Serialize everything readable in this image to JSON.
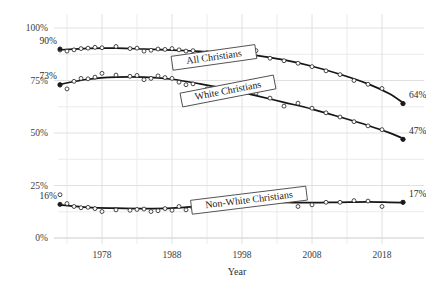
{
  "chart_data": {
    "type": "scatter",
    "title": "",
    "subtitle": "",
    "xlabel": "Year",
    "ylabel": "",
    "xlim": [
      1972,
      2022
    ],
    "ylim": [
      0,
      100
    ],
    "grid": true,
    "legend_position": "inline-labels",
    "xticks": [
      1978,
      1988,
      1998,
      2008,
      2018
    ],
    "xtick_labels": [
      "1978",
      "1988",
      "1998",
      "2008",
      "2018"
    ],
    "yticks": [
      0,
      25,
      50,
      75,
      100
    ],
    "ytick_labels": [
      "0%",
      "25%",
      "50%",
      "75%",
      "100%"
    ],
    "annotations": [
      {
        "text": "90%",
        "series": "All Christians",
        "side": "left",
        "x": 1972,
        "y": 90
      },
      {
        "text": "73%",
        "series": "White Christians",
        "side": "left",
        "x": 1972,
        "y": 73
      },
      {
        "text": "16%",
        "series": "Non-White Christians",
        "side": "left",
        "x": 1972,
        "y": 16
      },
      {
        "text": "64%",
        "series": "All Christians",
        "side": "right",
        "x": 2021,
        "y": 64
      },
      {
        "text": "47%",
        "series": "White Christians",
        "side": "right",
        "x": 2021,
        "y": 47
      },
      {
        "text": "17%",
        "series": "Non-White Christians",
        "side": "right",
        "x": 2021,
        "y": 17
      }
    ],
    "series": [
      {
        "name": "All Christians",
        "label": "All Christians",
        "label_x": 1994,
        "label_y": 86,
        "label_rotation": -8,
        "start_value": 90,
        "end_value": 64,
        "color": "#151515",
        "points": [
          {
            "x": 1972,
            "y": 89.5
          },
          {
            "x": 1973,
            "y": 89.0
          },
          {
            "x": 1974,
            "y": 89.6
          },
          {
            "x": 1975,
            "y": 90.2
          },
          {
            "x": 1976,
            "y": 90.4
          },
          {
            "x": 1977,
            "y": 90.8
          },
          {
            "x": 1978,
            "y": 90.6
          },
          {
            "x": 1980,
            "y": 91.2
          },
          {
            "x": 1982,
            "y": 90.2
          },
          {
            "x": 1983,
            "y": 90.4
          },
          {
            "x": 1984,
            "y": 89.0
          },
          {
            "x": 1985,
            "y": 89.4
          },
          {
            "x": 1986,
            "y": 90.0
          },
          {
            "x": 1987,
            "y": 89.8
          },
          {
            "x": 1988,
            "y": 90.2
          },
          {
            "x": 1989,
            "y": 89.6
          },
          {
            "x": 1990,
            "y": 89.0
          },
          {
            "x": 1991,
            "y": 89.2
          },
          {
            "x": 1993,
            "y": 88.2
          },
          {
            "x": 1994,
            "y": 88.4
          },
          {
            "x": 1996,
            "y": 87.6
          },
          {
            "x": 1998,
            "y": 88.2
          },
          {
            "x": 2000,
            "y": 89.2
          },
          {
            "x": 2002,
            "y": 85.6
          },
          {
            "x": 2004,
            "y": 84.4
          },
          {
            "x": 2006,
            "y": 83.2
          },
          {
            "x": 2008,
            "y": 81.6
          },
          {
            "x": 2010,
            "y": 79.6
          },
          {
            "x": 2012,
            "y": 77.8
          },
          {
            "x": 2014,
            "y": 75.0
          },
          {
            "x": 2016,
            "y": 73.2
          },
          {
            "x": 2018,
            "y": 71.2
          },
          {
            "x": 2021,
            "y": 64.0
          }
        ],
        "fit": [
          {
            "x": 1972,
            "y": 89.6
          },
          {
            "x": 1976,
            "y": 90.3
          },
          {
            "x": 1980,
            "y": 90.4
          },
          {
            "x": 1984,
            "y": 90.0
          },
          {
            "x": 1988,
            "y": 89.5
          },
          {
            "x": 1992,
            "y": 88.9
          },
          {
            "x": 1996,
            "y": 88.2
          },
          {
            "x": 2000,
            "y": 87.0
          },
          {
            "x": 2004,
            "y": 84.8
          },
          {
            "x": 2008,
            "y": 81.8
          },
          {
            "x": 2012,
            "y": 78.0
          },
          {
            "x": 2016,
            "y": 73.4
          },
          {
            "x": 2019,
            "y": 68.8
          },
          {
            "x": 2021,
            "y": 64.4
          }
        ]
      },
      {
        "name": "White Christians",
        "label": "White Christians",
        "label_x": 1996,
        "label_y": 70,
        "label_rotation": -11,
        "start_value": 73,
        "end_value": 47,
        "color": "#151515",
        "points": [
          {
            "x": 1972,
            "y": 72.8
          },
          {
            "x": 1973,
            "y": 71.0
          },
          {
            "x": 1974,
            "y": 74.6
          },
          {
            "x": 1975,
            "y": 76.0
          },
          {
            "x": 1976,
            "y": 75.8
          },
          {
            "x": 1977,
            "y": 76.6
          },
          {
            "x": 1978,
            "y": 78.4
          },
          {
            "x": 1980,
            "y": 77.6
          },
          {
            "x": 1982,
            "y": 77.0
          },
          {
            "x": 1983,
            "y": 77.4
          },
          {
            "x": 1984,
            "y": 75.4
          },
          {
            "x": 1985,
            "y": 76.0
          },
          {
            "x": 1986,
            "y": 77.2
          },
          {
            "x": 1987,
            "y": 76.4
          },
          {
            "x": 1988,
            "y": 76.0
          },
          {
            "x": 1989,
            "y": 74.2
          },
          {
            "x": 1990,
            "y": 73.0
          },
          {
            "x": 1991,
            "y": 73.4
          },
          {
            "x": 1993,
            "y": 71.0
          },
          {
            "x": 1994,
            "y": 71.4
          },
          {
            "x": 1996,
            "y": 70.0
          },
          {
            "x": 1998,
            "y": 69.6
          },
          {
            "x": 2000,
            "y": 69.0
          },
          {
            "x": 2002,
            "y": 66.6
          },
          {
            "x": 2004,
            "y": 62.8
          },
          {
            "x": 2006,
            "y": 64.2
          },
          {
            "x": 2008,
            "y": 61.8
          },
          {
            "x": 2010,
            "y": 59.6
          },
          {
            "x": 2012,
            "y": 57.6
          },
          {
            "x": 2014,
            "y": 55.4
          },
          {
            "x": 2016,
            "y": 53.4
          },
          {
            "x": 2018,
            "y": 51.6
          },
          {
            "x": 2021,
            "y": 47.0
          }
        ],
        "fit": [
          {
            "x": 1972,
            "y": 73.2
          },
          {
            "x": 1976,
            "y": 75.6
          },
          {
            "x": 1980,
            "y": 76.6
          },
          {
            "x": 1984,
            "y": 76.6
          },
          {
            "x": 1988,
            "y": 75.6
          },
          {
            "x": 1992,
            "y": 73.4
          },
          {
            "x": 1996,
            "y": 70.8
          },
          {
            "x": 2000,
            "y": 67.8
          },
          {
            "x": 2004,
            "y": 64.6
          },
          {
            "x": 2008,
            "y": 61.4
          },
          {
            "x": 2012,
            "y": 57.6
          },
          {
            "x": 2016,
            "y": 53.6
          },
          {
            "x": 2019,
            "y": 50.2
          },
          {
            "x": 2021,
            "y": 47.4
          }
        ]
      },
      {
        "name": "Non-White Christians",
        "label": "Non-White Christians",
        "label_x": 1999,
        "label_y": 18,
        "label_rotation": -7,
        "start_value": 16,
        "end_value": 17,
        "color": "#151515",
        "points": [
          {
            "x": 1972,
            "y": 20.6
          },
          {
            "x": 1973,
            "y": 16.4
          },
          {
            "x": 1974,
            "y": 15.0
          },
          {
            "x": 1975,
            "y": 14.4
          },
          {
            "x": 1976,
            "y": 14.6
          },
          {
            "x": 1977,
            "y": 14.0
          },
          {
            "x": 1978,
            "y": 12.6
          },
          {
            "x": 1980,
            "y": 13.4
          },
          {
            "x": 1982,
            "y": 13.2
          },
          {
            "x": 1983,
            "y": 13.6
          },
          {
            "x": 1984,
            "y": 13.8
          },
          {
            "x": 1985,
            "y": 12.6
          },
          {
            "x": 1986,
            "y": 13.0
          },
          {
            "x": 1987,
            "y": 14.0
          },
          {
            "x": 1988,
            "y": 13.2
          },
          {
            "x": 1989,
            "y": 15.0
          },
          {
            "x": 1990,
            "y": 13.4
          },
          {
            "x": 1991,
            "y": 14.2
          },
          {
            "x": 1993,
            "y": 16.4
          },
          {
            "x": 1994,
            "y": 15.2
          },
          {
            "x": 1996,
            "y": 17.6
          },
          {
            "x": 1998,
            "y": 18.0
          },
          {
            "x": 2000,
            "y": 17.0
          },
          {
            "x": 2002,
            "y": 18.4
          },
          {
            "x": 2004,
            "y": 21.6
          },
          {
            "x": 2006,
            "y": 15.0
          },
          {
            "x": 2008,
            "y": 15.8
          },
          {
            "x": 2010,
            "y": 17.0
          },
          {
            "x": 2012,
            "y": 17.0
          },
          {
            "x": 2014,
            "y": 17.8
          },
          {
            "x": 2016,
            "y": 17.6
          },
          {
            "x": 2018,
            "y": 15.0
          },
          {
            "x": 2021,
            "y": 17.0
          }
        ],
        "fit": [
          {
            "x": 1972,
            "y": 15.8
          },
          {
            "x": 1976,
            "y": 14.6
          },
          {
            "x": 1980,
            "y": 14.2
          },
          {
            "x": 1984,
            "y": 14.0
          },
          {
            "x": 1988,
            "y": 14.2
          },
          {
            "x": 1992,
            "y": 15.2
          },
          {
            "x": 1996,
            "y": 16.4
          },
          {
            "x": 2000,
            "y": 17.0
          },
          {
            "x": 2004,
            "y": 16.9
          },
          {
            "x": 2008,
            "y": 16.8
          },
          {
            "x": 2012,
            "y": 17.0
          },
          {
            "x": 2016,
            "y": 17.2
          },
          {
            "x": 2019,
            "y": 17.0
          },
          {
            "x": 2021,
            "y": 16.8
          }
        ]
      }
    ]
  }
}
